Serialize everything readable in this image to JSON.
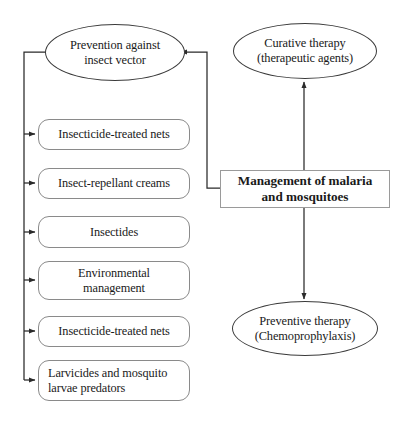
{
  "diagram": {
    "title": "Management of malaria and mosquitoes",
    "center_node": {
      "label": "Management of malaria\nand mosquitoes"
    },
    "ellipses": [
      {
        "id": "prevention-vector",
        "label": "Prevention against\ninsect vector"
      },
      {
        "id": "curative-therapy",
        "label": "Curative therapy\n(therapeutic agents)"
      },
      {
        "id": "preventive-therapy",
        "label": "Preventive therapy\n(Chemoprophylaxis)"
      }
    ],
    "measures": [
      {
        "id": "insecticide-treated-nets-1",
        "label": "Insecticide-treated nets"
      },
      {
        "id": "insect-repellant-creams",
        "label": "Insect-repellant creams"
      },
      {
        "id": "insectides",
        "label": "Insectides"
      },
      {
        "id": "environmental-management",
        "label": "Environmental\nmanagement"
      },
      {
        "id": "insecticide-treated-nets-2",
        "label": "Insecticide-treated nets"
      },
      {
        "id": "larvicides-and-predators",
        "label": "Larvicides and mosquito\nlarvae predators"
      }
    ],
    "colors": {
      "background": "#ffffff",
      "ellipse_stroke": "#3a3a3a",
      "box_stroke": "#8a8a8a",
      "rect_stroke": "#9a9a9a",
      "connector": "#2a2a2a",
      "text": "#1a1a1a"
    }
  }
}
